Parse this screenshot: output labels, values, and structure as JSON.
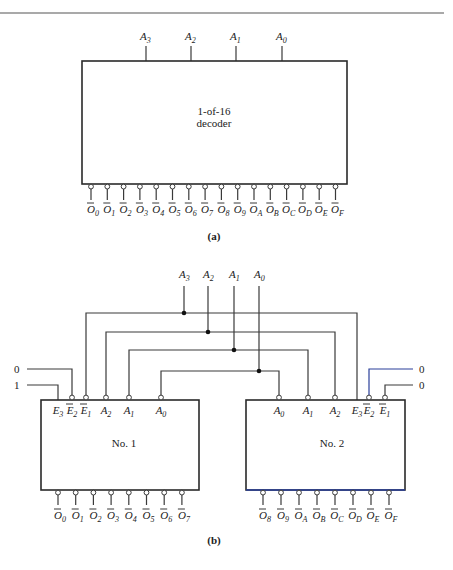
{
  "figure_a": {
    "caption": "(a)",
    "decoder": {
      "title_line1": "1-of-16",
      "title_line2": "decoder",
      "inputs": [
        {
          "base": "A",
          "sub": "3"
        },
        {
          "base": "A",
          "sub": "2"
        },
        {
          "base": "A",
          "sub": "1"
        },
        {
          "base": "A",
          "sub": "0"
        }
      ],
      "outputs": [
        {
          "base": "O",
          "sub": "0"
        },
        {
          "base": "O",
          "sub": "1"
        },
        {
          "base": "O",
          "sub": "2"
        },
        {
          "base": "O",
          "sub": "3"
        },
        {
          "base": "O",
          "sub": "4"
        },
        {
          "base": "O",
          "sub": "5"
        },
        {
          "base": "O",
          "sub": "6"
        },
        {
          "base": "O",
          "sub": "7"
        },
        {
          "base": "O",
          "sub": "8"
        },
        {
          "base": "O",
          "sub": "9"
        },
        {
          "base": "O",
          "sub": "A"
        },
        {
          "base": "O",
          "sub": "B"
        },
        {
          "base": "O",
          "sub": "C"
        },
        {
          "base": "O",
          "sub": "D"
        },
        {
          "base": "O",
          "sub": "E"
        },
        {
          "base": "O",
          "sub": "F"
        }
      ]
    }
  },
  "figure_b": {
    "caption": "(b)",
    "bus_inputs": [
      {
        "base": "A",
        "sub": "3"
      },
      {
        "base": "A",
        "sub": "2"
      },
      {
        "base": "A",
        "sub": "1"
      },
      {
        "base": "A",
        "sub": "0"
      }
    ],
    "decoder1": {
      "label": "No. 1",
      "enable_values": {
        "E2_bar": "0",
        "E3": "1"
      },
      "inputs": [
        {
          "base": "E",
          "sub": "3",
          "bar": false
        },
        {
          "base": "E",
          "sub": "2",
          "bar": true
        },
        {
          "base": "E",
          "sub": "1",
          "bar": true
        },
        {
          "base": "A",
          "sub": "2",
          "bar": false
        },
        {
          "base": "A",
          "sub": "1",
          "bar": false
        },
        {
          "base": "A",
          "sub": "0",
          "bar": false
        }
      ],
      "outputs": [
        {
          "base": "O",
          "sub": "0"
        },
        {
          "base": "O",
          "sub": "1"
        },
        {
          "base": "O",
          "sub": "2"
        },
        {
          "base": "O",
          "sub": "3"
        },
        {
          "base": "O",
          "sub": "4"
        },
        {
          "base": "O",
          "sub": "5"
        },
        {
          "base": "O",
          "sub": "6"
        },
        {
          "base": "O",
          "sub": "7"
        }
      ]
    },
    "decoder2": {
      "label": "No. 2",
      "enable_values": {
        "E2_bar": "0",
        "E1_bar": "0"
      },
      "inputs": [
        {
          "base": "A",
          "sub": "0",
          "bar": false
        },
        {
          "base": "A",
          "sub": "1",
          "bar": false
        },
        {
          "base": "A",
          "sub": "2",
          "bar": false
        },
        {
          "base": "E",
          "sub": "3",
          "bar": false
        },
        {
          "base": "E",
          "sub": "2",
          "bar": true
        },
        {
          "base": "E",
          "sub": "1",
          "bar": true
        }
      ],
      "outputs": [
        {
          "base": "O",
          "sub": "8"
        },
        {
          "base": "O",
          "sub": "9"
        },
        {
          "base": "O",
          "sub": "A"
        },
        {
          "base": "O",
          "sub": "B"
        },
        {
          "base": "O",
          "sub": "C"
        },
        {
          "base": "O",
          "sub": "D"
        },
        {
          "base": "O",
          "sub": "E"
        },
        {
          "base": "O",
          "sub": "F"
        }
      ]
    }
  },
  "colors": {
    "line": "#3a3a3a",
    "blue_wire": "#2a3f9a",
    "background": "#ffffff"
  }
}
